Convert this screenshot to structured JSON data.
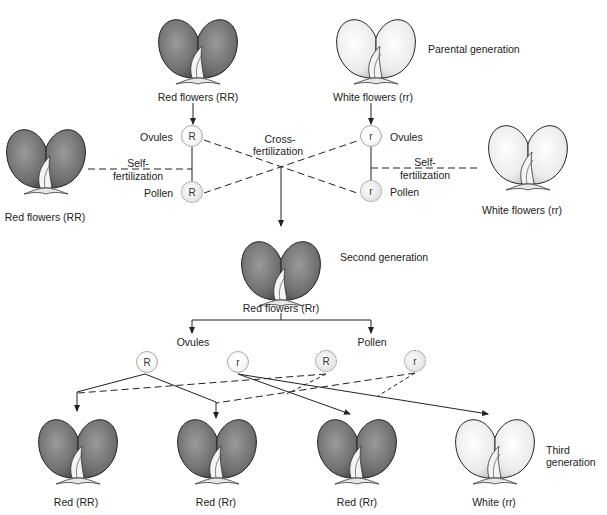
{
  "colors": {
    "red_flower_fill": "#7a7a7a",
    "red_flower_dark": "#4a4a4a",
    "white_flower_fill": "#f2f2f2",
    "white_flower_shade": "#c8c8c8",
    "line": "#333333"
  },
  "parental_generation": {
    "title": "Parental generation",
    "red_parent": {
      "label": "Red flowers (RR)",
      "color": "red"
    },
    "white_parent": {
      "label": "White flowers (rr)",
      "color": "white"
    },
    "left_gametes": {
      "ovule": {
        "label": "Ovules",
        "allele": "R"
      },
      "pollen": {
        "label": "Pollen",
        "allele": "R"
      }
    },
    "right_gametes": {
      "ovule": {
        "label": "Ovules",
        "allele": "r"
      },
      "pollen": {
        "label": "Pollen",
        "allele": "r"
      }
    },
    "cross_fertilization_label": [
      "Cross-",
      "fertilization"
    ],
    "left_self": {
      "label": [
        "Self-",
        "fertilization"
      ],
      "flower_label": "Red flowers (RR)"
    },
    "right_self": {
      "label": [
        "Self-",
        "fertilization"
      ],
      "flower_label": "White flowers (rr)"
    }
  },
  "second_generation": {
    "title": "Second generation",
    "flower": {
      "label": "Red flowers (Rr)",
      "color": "red"
    },
    "ovules_label": "Ovules",
    "pollen_label": "Pollen",
    "ovules": [
      "R",
      "r"
    ],
    "pollen": [
      "R",
      "r"
    ]
  },
  "third_generation": {
    "title": [
      "Third",
      "generation"
    ],
    "offspring": [
      {
        "label": "Red (RR)",
        "color": "red"
      },
      {
        "label": "Red (Rr)",
        "color": "red"
      },
      {
        "label": "Red (Rr)",
        "color": "red"
      },
      {
        "label": "White (rr)",
        "color": "white"
      }
    ]
  }
}
